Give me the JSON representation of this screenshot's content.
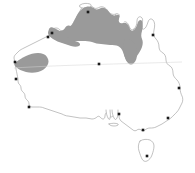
{
  "figure": {
    "name": "australia-distribution-map",
    "type": "range-map",
    "region": "Australia",
    "background_color": "#ffffff",
    "width": 195,
    "height": 173
  },
  "basemap": {
    "outline_color": "#8f8f8f",
    "fill_color": "#ffffff",
    "outline_width": 0.55,
    "landmasses": [
      {
        "name": "mainland-australia",
        "label": "Australia"
      },
      {
        "name": "tasmania",
        "label": "Tasmania"
      },
      {
        "name": "kangaroo-island",
        "label": "Kangaroo Island"
      },
      {
        "name": "melville-island",
        "label": "Melville Island"
      }
    ]
  },
  "range": {
    "name": "distribution-range",
    "fill_color": "#9a9a9a",
    "description": "Shaded distribution across tropical northern Australia with a separate western lobe",
    "polygons": [
      {
        "name": "northern-range",
        "label": "Northern Australia range"
      },
      {
        "name": "western-lobe-range",
        "label": "Pilbara / western range lobe"
      }
    ]
  },
  "reference_lines": [
    {
      "name": "tropic-of-capricorn",
      "label": "Tropic of Capricorn",
      "color": "#d2d2d2",
      "orientation": "horizontal"
    }
  ],
  "markers": {
    "name": "city-markers",
    "color": "#1a1a1a",
    "shape": "square",
    "points": [
      {
        "name": "marker-darwin",
        "label": "Darwin",
        "x": 88,
        "y": 12
      },
      {
        "name": "marker-broome",
        "label": "Broome",
        "x": 48,
        "y": 37
      },
      {
        "name": "marker-derby",
        "label": "Derby",
        "x": 52,
        "y": 33
      },
      {
        "name": "marker-cairns",
        "label": "Cairns",
        "x": 153,
        "y": 35
      },
      {
        "name": "marker-exmouth",
        "label": "Exmouth",
        "x": 15,
        "y": 62
      },
      {
        "name": "marker-carnarvon",
        "label": "Carnarvon",
        "x": 16,
        "y": 79
      },
      {
        "name": "marker-alice-springs",
        "label": "Alice Springs",
        "x": 99,
        "y": 64
      },
      {
        "name": "marker-brisbane",
        "label": "Brisbane",
        "x": 179,
        "y": 88
      },
      {
        "name": "marker-perth",
        "label": "Perth",
        "x": 29,
        "y": 107
      },
      {
        "name": "marker-sydney",
        "label": "Sydney",
        "x": 168,
        "y": 118
      },
      {
        "name": "marker-adelaide",
        "label": "Adelaide",
        "x": 119,
        "y": 114
      },
      {
        "name": "marker-melbourne",
        "label": "Melbourne",
        "x": 143,
        "y": 130
      },
      {
        "name": "marker-hobart",
        "label": "Hobart",
        "x": 147,
        "y": 156
      }
    ]
  }
}
